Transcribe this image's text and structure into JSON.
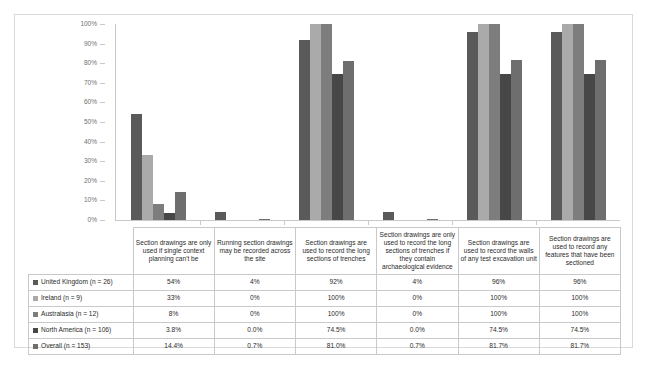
{
  "chart_data": {
    "type": "bar",
    "title": "",
    "xlabel": "",
    "ylabel": "",
    "ylim": [
      0,
      100
    ],
    "grid": false,
    "legend_position": "table-row-headers",
    "ytick_labels": [
      "100%",
      "90%",
      "80%",
      "70%",
      "60%",
      "50%",
      "40%",
      "30%",
      "20%",
      "10%",
      "0%"
    ],
    "ytick_values": [
      100,
      90,
      80,
      70,
      60,
      50,
      40,
      30,
      20,
      10,
      0
    ],
    "categories": [
      "Section drawings are only used if single context planning can't be",
      "Running section drawings may be recorded across the site",
      "Section drawings are used to record the long sections of trenches",
      "Section drawings are only used to record the long sections of trenches if they contain archaeological evidence",
      "Section drawings are used to record the walls of any test excavation unit",
      "Section drawings are used to record any features that have been sectioned"
    ],
    "series": [
      {
        "name": "United Kingdom (n = 26)",
        "color": "#5a5a5a",
        "values": [
          54,
          4,
          92,
          4,
          96,
          96
        ],
        "labels": [
          "54%",
          "4%",
          "92%",
          "4%",
          "96%",
          "96%"
        ]
      },
      {
        "name": "Ireland (n = 9)",
        "color": "#aaaaaa",
        "values": [
          33,
          0,
          100,
          0,
          100,
          100
        ],
        "labels": [
          "33%",
          "0%",
          "100%",
          "0%",
          "100%",
          "100%"
        ]
      },
      {
        "name": "Australasia (n = 12)",
        "color": "#7d7d7d",
        "values": [
          8,
          0,
          100,
          0,
          100,
          100
        ],
        "labels": [
          "8%",
          "0%",
          "100%",
          "0%",
          "100%",
          "100%"
        ]
      },
      {
        "name": "North America (n = 106)",
        "color": "#474747",
        "values": [
          3.8,
          0.0,
          74.5,
          0.0,
          74.5,
          74.5
        ],
        "labels": [
          "3.8%",
          "0.0%",
          "74.5%",
          "0.0%",
          "74.5%",
          "74.5%"
        ]
      },
      {
        "name": "Overall (n = 153)",
        "color": "#6e6e6e",
        "values": [
          14.4,
          0.7,
          81.0,
          0.7,
          81.7,
          81.7
        ],
        "labels": [
          "14.4%",
          "0.7%",
          "81.0%",
          "0.7%",
          "81.7%",
          "81.7%"
        ]
      }
    ]
  }
}
